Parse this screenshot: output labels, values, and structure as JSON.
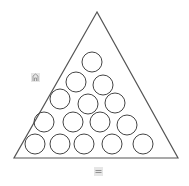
{
  "diagram": {
    "shape": "triangle",
    "triangle": {
      "apex": [
        97,
        12
      ],
      "base_left": [
        14,
        158
      ],
      "base_right": [
        178,
        158
      ],
      "stroke": "#555555"
    },
    "circle_radius": 10,
    "circle_stroke": "#444444",
    "circles": [
      [
        92,
        62
      ],
      [
        76,
        82
      ],
      [
        103,
        85
      ],
      [
        60,
        99
      ],
      [
        88,
        104
      ],
      [
        115,
        103
      ],
      [
        44,
        122
      ],
      [
        73,
        122
      ],
      [
        100,
        122
      ],
      [
        127,
        125
      ],
      [
        35,
        144
      ],
      [
        60,
        144
      ],
      [
        84,
        144
      ],
      [
        112,
        144
      ],
      [
        143,
        144
      ]
    ],
    "circle_count": 15
  },
  "icons": [
    {
      "name": "building-icon",
      "pos": [
        31,
        73
      ]
    },
    {
      "name": "equals-icon",
      "pos": [
        94,
        167
      ]
    }
  ]
}
